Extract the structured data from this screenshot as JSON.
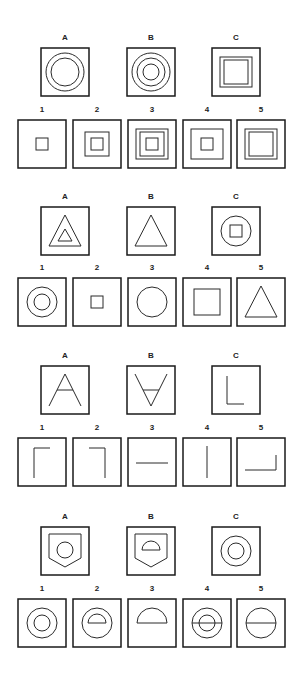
{
  "colors": {
    "stroke": "#1a1a1a",
    "background": "#ffffff"
  },
  "problems": [
    {
      "id": 1,
      "stimuli": [
        {
          "label": "A",
          "shapes": [
            "circle-large",
            "circle-medium"
          ]
        },
        {
          "label": "B",
          "shapes": [
            "circle-large",
            "circle-medium",
            "circle-small"
          ]
        },
        {
          "label": "C",
          "shapes": [
            "square-large",
            "square-medium"
          ]
        }
      ],
      "options": [
        {
          "label": "1",
          "shapes": [
            "square-tiny"
          ]
        },
        {
          "label": "2",
          "shapes": [
            "square-medium",
            "square-tiny"
          ]
        },
        {
          "label": "3",
          "shapes": [
            "square-large",
            "square-medium",
            "square-tiny"
          ]
        },
        {
          "label": "4",
          "shapes": [
            "square-large",
            "square-tiny"
          ]
        },
        {
          "label": "5",
          "shapes": [
            "square-large",
            "square-medium"
          ]
        }
      ]
    },
    {
      "id": 2,
      "stimuli": [
        {
          "label": "A",
          "shapes": [
            "triangle-large",
            "triangle-small"
          ]
        },
        {
          "label": "B",
          "shapes": [
            "triangle-large"
          ]
        },
        {
          "label": "C",
          "shapes": [
            "circle-medium-big",
            "square-tiny"
          ]
        }
      ],
      "options": [
        {
          "label": "1",
          "shapes": [
            "circle-medium-big",
            "circle-small"
          ]
        },
        {
          "label": "2",
          "shapes": [
            "square-tiny"
          ]
        },
        {
          "label": "3",
          "shapes": [
            "circle-medium-big"
          ]
        },
        {
          "label": "4",
          "shapes": [
            "square-medium-big"
          ]
        },
        {
          "label": "5",
          "shapes": [
            "triangle-large"
          ]
        }
      ]
    },
    {
      "id": 3,
      "stimuli": [
        {
          "label": "A",
          "shapes": [
            "letter-A"
          ]
        },
        {
          "label": "B",
          "shapes": [
            "letter-A-inverted"
          ]
        },
        {
          "label": "C",
          "shapes": [
            "letter-L"
          ]
        }
      ],
      "options": [
        {
          "label": "1",
          "shapes": [
            "corner-top-left"
          ]
        },
        {
          "label": "2",
          "shapes": [
            "corner-top-right"
          ]
        },
        {
          "label": "3",
          "shapes": [
            "line-horizontal"
          ]
        },
        {
          "label": "4",
          "shapes": [
            "line-vertical"
          ]
        },
        {
          "label": "5",
          "shapes": [
            "corner-bottom-right"
          ]
        }
      ]
    },
    {
      "id": 4,
      "stimuli": [
        {
          "label": "A",
          "shapes": [
            "shield",
            "circle-small-shield"
          ]
        },
        {
          "label": "B",
          "shapes": [
            "shield",
            "semicircle-small-shield"
          ]
        },
        {
          "label": "C",
          "shapes": [
            "circle-medium-big",
            "circle-small"
          ]
        }
      ],
      "options": [
        {
          "label": "1",
          "shapes": [
            "circle-medium-big",
            "circle-small"
          ]
        },
        {
          "label": "2",
          "shapes": [
            "circle-medium-big",
            "semicircle-small"
          ]
        },
        {
          "label": "3",
          "shapes": [
            "semicircle-large"
          ]
        },
        {
          "label": "4",
          "shapes": [
            "circle-medium-big",
            "circle-small",
            "line-diameter-big"
          ]
        },
        {
          "label": "5",
          "shapes": [
            "circle-medium-big",
            "line-diameter-big"
          ]
        }
      ]
    }
  ]
}
